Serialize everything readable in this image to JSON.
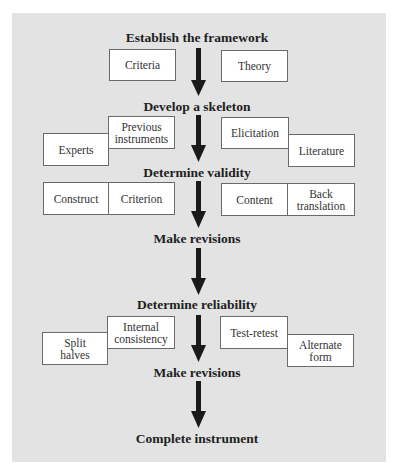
{
  "diagram": {
    "type": "flowchart",
    "direction": "top-to-bottom",
    "colors": {
      "background_panel": "#e3e3e3",
      "box_fill": "#ffffff",
      "box_border": "#6a6a6a",
      "arrow": "#1a1a1a",
      "text": "#1e1e1e"
    },
    "steps": [
      {
        "label": "Establish the framework"
      },
      {
        "label": "Develop a skeleton"
      },
      {
        "label": "Determine validity"
      },
      {
        "label": "Make revisions"
      },
      {
        "label": "Determine reliability"
      },
      {
        "label": "Make revisions"
      },
      {
        "label": "Complete instrument"
      }
    ],
    "framework_boxes": {
      "left": "Criteria",
      "right": "Theory"
    },
    "skeleton_boxes": {
      "left_lower": "Experts",
      "left_upper": "Previous instruments",
      "right_upper": "Elicitation",
      "right_lower": "Literature"
    },
    "validity_boxes": {
      "left_a": "Construct",
      "left_b": "Criterion",
      "right_a": "Content",
      "right_b": "Back translation"
    },
    "reliability_boxes": {
      "left_lower": "Split halves",
      "left_upper": "Internal consistency",
      "right_upper": "Test-retest",
      "right_lower": "Alternate form"
    }
  }
}
